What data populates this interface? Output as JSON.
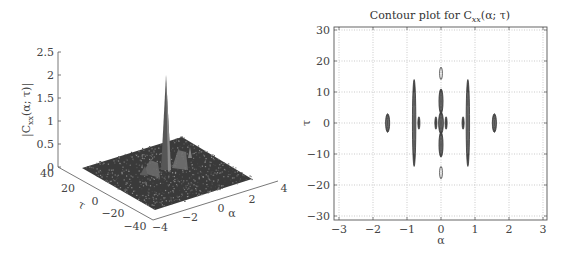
{
  "chart_data": [
    {
      "type": "surface",
      "title": "",
      "xlabel": "α",
      "ylabel": "τ",
      "zlabel": "|C_xx(α; τ)|",
      "zlabel_parts": {
        "prefix": "|C",
        "sub": "xx",
        "suffix": "(α; τ)|"
      },
      "xlim": [
        -4,
        4
      ],
      "ylim": [
        -40,
        40
      ],
      "zlim": [
        0,
        2.5
      ],
      "x_ticks": [
        "−4",
        "−2",
        "0",
        "2",
        "4"
      ],
      "y_ticks": [
        "40",
        "20",
        "0",
        "−20",
        "−40"
      ],
      "z_ticks": [
        "0",
        "0.5",
        "1",
        "1.5",
        "2",
        "2.5"
      ],
      "peaks": [
        {
          "alpha": 0,
          "tau": 0,
          "height": 2.0
        },
        {
          "alpha": 0.8,
          "tau": 0,
          "height": 0.5
        },
        {
          "alpha": -0.8,
          "tau": 0,
          "height": 0.4
        },
        {
          "alpha": 1.6,
          "tau": 0,
          "height": 0.3
        }
      ],
      "noise_floor": 0.05,
      "grid": false
    },
    {
      "type": "contour",
      "title": "Contour plot for C_xx(α; τ)",
      "title_parts": {
        "prefix": "Contour plot for C",
        "sub": "xx",
        "suffix": "(α; τ)"
      },
      "xlabel": "α",
      "ylabel": "τ",
      "xlim": [
        -3.1,
        3.1
      ],
      "ylim": [
        -31,
        31
      ],
      "x_ticks": [
        "−3",
        "−2",
        "−1",
        "0",
        "1",
        "2",
        "3"
      ],
      "y_ticks": [
        "30",
        "20",
        "10",
        "0",
        "−10",
        "−20",
        "−30"
      ],
      "grid": true,
      "features": [
        {
          "alpha": -1.57,
          "tau": 0,
          "tau_extent": 3,
          "width": 0.06,
          "filled": true
        },
        {
          "alpha": 1.57,
          "tau": 0,
          "tau_extent": 3,
          "width": 0.06,
          "filled": true
        },
        {
          "alpha": -0.79,
          "tau": 0,
          "tau_extent": 14,
          "width": 0.05,
          "filled": true
        },
        {
          "alpha": 0.79,
          "tau": 0,
          "tau_extent": 14,
          "width": 0.05,
          "filled": true
        },
        {
          "alpha": -0.65,
          "tau": 0,
          "tau_extent": 2,
          "width": 0.02,
          "filled": true
        },
        {
          "alpha": 0.65,
          "tau": 0,
          "tau_extent": 2,
          "width": 0.02,
          "filled": true
        },
        {
          "alpha": -0.15,
          "tau": 0,
          "tau_extent": 2,
          "width": 0.02,
          "filled": true
        },
        {
          "alpha": 0.15,
          "tau": 0,
          "tau_extent": 2,
          "width": 0.02,
          "filled": true
        },
        {
          "alpha": 0,
          "tau": 0,
          "tau_extent": 3.5,
          "width": 0.07,
          "filled": true
        },
        {
          "alpha": 0,
          "tau": 7,
          "tau_extent": 4,
          "width": 0.06,
          "filled": true
        },
        {
          "alpha": 0,
          "tau": -7,
          "tau_extent": 4,
          "width": 0.06,
          "filled": true
        },
        {
          "alpha": 0,
          "tau": 16,
          "tau_extent": 2,
          "width": 0.04,
          "filled": false
        },
        {
          "alpha": 0,
          "tau": -16,
          "tau_extent": 2,
          "width": 0.04,
          "filled": false
        }
      ]
    }
  ]
}
